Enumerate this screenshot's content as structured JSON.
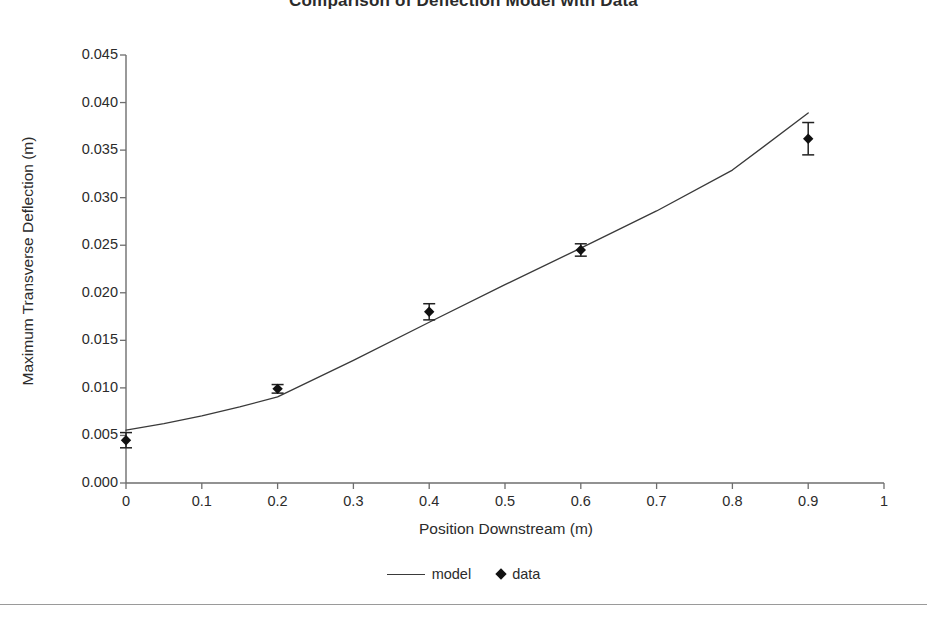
{
  "chart_data": {
    "type": "scatter",
    "title": "Comparison of Deflection Model with Data",
    "xlabel": "Position Downstream (m)",
    "ylabel": "Maximum Transverse Deflection (m)",
    "xlim": [
      0,
      1
    ],
    "ylim": [
      0,
      0.045
    ],
    "xticks": [
      "0",
      "0.1",
      "0.2",
      "0.3",
      "0.4",
      "0.5",
      "0.6",
      "0.7",
      "0.8",
      "0.9",
      "1"
    ],
    "xtick_values": [
      0,
      0.1,
      0.2,
      0.3,
      0.4,
      0.5,
      0.6,
      0.7,
      0.8,
      0.9,
      1
    ],
    "yticks": [
      "0.000",
      "0.005",
      "0.010",
      "0.015",
      "0.020",
      "0.025",
      "0.030",
      "0.035",
      "0.040",
      "0.045"
    ],
    "ytick_values": [
      0,
      0.005,
      0.01,
      0.015,
      0.02,
      0.025,
      0.03,
      0.035,
      0.04,
      0.045
    ],
    "grid": false,
    "legend_position": "bottom",
    "series": [
      {
        "name": "model",
        "type": "line",
        "color": "#3a3a3a",
        "x": [
          0,
          0.05,
          0.1,
          0.15,
          0.2,
          0.3,
          0.4,
          0.5,
          0.6,
          0.7,
          0.8,
          0.9
        ],
        "y": [
          0.00555,
          0.00625,
          0.00705,
          0.008,
          0.00905,
          0.0129,
          0.0169,
          0.02085,
          0.0247,
          0.0286,
          0.0329,
          0.0389
        ]
      },
      {
        "name": "data",
        "type": "scatter",
        "color": "#111111",
        "marker": "diamond",
        "x": [
          0,
          0.2,
          0.4,
          0.6,
          0.9
        ],
        "y": [
          0.0045,
          0.0099,
          0.018,
          0.0245,
          0.0362
        ],
        "yerr": [
          0.0008,
          0.00045,
          0.00085,
          0.00065,
          0.0017
        ]
      }
    ]
  },
  "legend": {
    "entries": [
      {
        "label": "model",
        "icon": "line-swatch"
      },
      {
        "label": "data",
        "icon": "diamond-swatch"
      }
    ]
  }
}
